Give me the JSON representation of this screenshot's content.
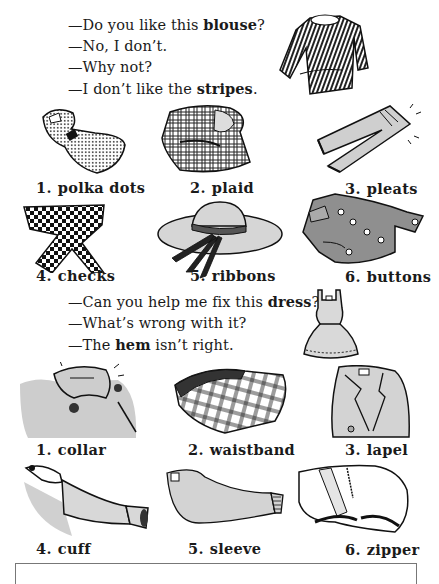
{
  "dialog1": {
    "lines": [
      {
        "prefix": "—Do you like this ",
        "bold": "blouse",
        "suffix": "?"
      },
      {
        "prefix": "—No, I don’t.",
        "bold": "",
        "suffix": ""
      },
      {
        "prefix": "—Why not?",
        "bold": "",
        "suffix": ""
      },
      {
        "prefix": "—I don’t like the ",
        "bold": "stripes",
        "suffix": "."
      }
    ]
  },
  "patterns": [
    {
      "num": "1.",
      "label": "polka dots",
      "icon": "polka-dot-dress-illustration"
    },
    {
      "num": "2.",
      "label": "plaid",
      "icon": "plaid-robe-illustration"
    },
    {
      "num": "3.",
      "label": "pleats",
      "icon": "pleated-pants-illustration"
    },
    {
      "num": "4.",
      "label": "checks",
      "icon": "checked-scarf-illustration"
    },
    {
      "num": "5.",
      "label": "ribbons",
      "icon": "ribbon-hat-illustration"
    },
    {
      "num": "6.",
      "label": "buttons",
      "icon": "buttoned-jacket-illustration"
    }
  ],
  "dialog2": {
    "lines": [
      {
        "prefix": "—Can you help me fix this ",
        "bold": "dress",
        "suffix": "?"
      },
      {
        "prefix": "—What’s wrong with it?",
        "bold": "",
        "suffix": ""
      },
      {
        "prefix": "—The ",
        "bold": "hem",
        "suffix": " isn’t right."
      }
    ]
  },
  "parts": [
    {
      "num": "1.",
      "label": "collar",
      "icon": "coat-collar-illustration"
    },
    {
      "num": "2.",
      "label": "waistband",
      "icon": "plaid-skirt-waistband-illustration"
    },
    {
      "num": "3.",
      "label": "lapel",
      "icon": "jacket-lapel-illustration"
    },
    {
      "num": "4.",
      "label": "cuff",
      "icon": "shirt-cuff-illustration"
    },
    {
      "num": "5.",
      "label": "sleeve",
      "icon": "sweater-sleeve-illustration"
    },
    {
      "num": "6.",
      "label": "zipper",
      "icon": "pants-zipper-illustration"
    }
  ],
  "colors": {
    "ink": "#1a1a1a",
    "fill_gray": "#c9c9c9",
    "dark_gray": "#8a8a8a",
    "paper": "#ffffff"
  }
}
